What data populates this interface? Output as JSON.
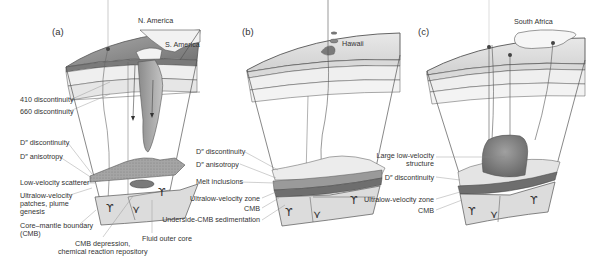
{
  "figure": {
    "panels": [
      {
        "id": "a",
        "label": "(a)",
        "map_labels": [
          "N. America",
          "S. America"
        ],
        "callouts": [
          "410 discontinuity",
          "660 discontinuity",
          "D″ discontinuity",
          "D″ anisotropy",
          "Low-velocity scatterer",
          "Ultralow-velocity",
          "patches, plume",
          "genesis",
          "Core–mantle boundary",
          "(CMB)",
          "CMB depression,",
          "chemical reaction repository",
          "Fluid outer core"
        ]
      },
      {
        "id": "b",
        "label": "(b)",
        "map_labels": [
          "Hawaii"
        ],
        "callouts": [
          "D″ discontinuity",
          "D″ anisotropy",
          "Melt inclusions",
          "Ultralow-velocity zone",
          "CMB",
          "Underside-CMB sedimentation"
        ]
      },
      {
        "id": "c",
        "label": "(c)",
        "map_labels": [
          "South Africa"
        ],
        "callouts": [
          "Large low-velocity",
          "structure",
          "D″ discontinuity",
          "Ultralow-velocity zone",
          "CMB"
        ]
      }
    ],
    "colors": {
      "outline": "#555555",
      "crust_dark": "#8a8a8a",
      "layer_light": "#e4e4e4",
      "slab": "#9a9a9a",
      "ulvz": "#6e6e6e",
      "core": "#dcdcdc"
    }
  }
}
